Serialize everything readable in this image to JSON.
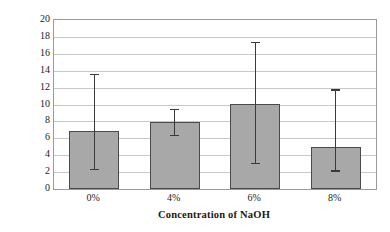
{
  "chart_data": {
    "type": "bar",
    "title": "",
    "xlabel": "Concentration of NaOH",
    "ylabel": "Elastic modulus (GPa)",
    "categories": [
      "0%",
      "4%",
      "6%",
      "8%"
    ],
    "values": [
      6.9,
      7.9,
      10.1,
      5.0
    ],
    "error_bars": {
      "upper": [
        13.6,
        9.5,
        17.4,
        11.8
      ],
      "lower": [
        2.4,
        6.4,
        3.1,
        2.2
      ]
    },
    "ylim": [
      0,
      20
    ],
    "ytick_labels": [
      "0",
      "2",
      "4",
      "6",
      "8",
      "10",
      "12",
      "14",
      "16",
      "18",
      "20"
    ],
    "ytick_values": [
      0,
      2,
      4,
      6,
      8,
      10,
      12,
      14,
      16,
      18,
      20
    ],
    "grid": true,
    "grid_axis": "y",
    "legend": null,
    "series_color": "#a8a8a8",
    "bar_border_color": "#4a4a4a",
    "grid_color": "#c8c8c8",
    "error_bar_color": "#3a3a3a",
    "axis_border_color": "#9a9a9a",
    "background_color": "#ffffff"
  }
}
